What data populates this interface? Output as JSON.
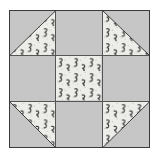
{
  "image": {
    "title": "Shoofly quilt block diagram",
    "width": 159,
    "height": 159,
    "background_color": "#ffffff"
  },
  "block": {
    "name": "quilt-block",
    "border_color": "#3a3a3a",
    "seam_line_color": "#555555",
    "rows": 3,
    "columns": 3,
    "fabrics": {
      "solid": {
        "label": "solid gray fabric",
        "color": "#c6c6c6"
      },
      "print": {
        "label": "light printed fabric with small dark motifs",
        "color": "#ededea",
        "motif_color": "#2b2b2b",
        "speckle_color": "#8a8a8a"
      }
    },
    "cells": [
      {
        "position": "top-left",
        "name": "half-square-triangle",
        "solid_corner": "upper-left",
        "print_corner": "lower-right",
        "diagonal": "bottom-left-to-top-right"
      },
      {
        "position": "top-center",
        "name": "solid-square",
        "solid_corner": "all",
        "print_corner": "none",
        "diagonal": "none"
      },
      {
        "position": "top-right",
        "name": "half-square-triangle",
        "solid_corner": "upper-right",
        "print_corner": "lower-left",
        "diagonal": "top-left-to-bottom-right"
      },
      {
        "position": "middle-left",
        "name": "solid-square",
        "solid_corner": "all",
        "print_corner": "none",
        "diagonal": "none"
      },
      {
        "position": "center",
        "name": "print-square",
        "solid_corner": "none",
        "print_corner": "all",
        "diagonal": "none"
      },
      {
        "position": "middle-right",
        "name": "solid-square",
        "solid_corner": "all",
        "print_corner": "none",
        "diagonal": "none"
      },
      {
        "position": "bottom-left",
        "name": "half-square-triangle",
        "solid_corner": "lower-left",
        "print_corner": "upper-right",
        "diagonal": "top-left-to-bottom-right"
      },
      {
        "position": "bottom-center",
        "name": "solid-square",
        "solid_corner": "all",
        "print_corner": "none",
        "diagonal": "none"
      },
      {
        "position": "bottom-right",
        "name": "half-square-triangle",
        "solid_corner": "lower-right",
        "print_corner": "upper-left",
        "diagonal": "bottom-left-to-top-right"
      }
    ]
  }
}
